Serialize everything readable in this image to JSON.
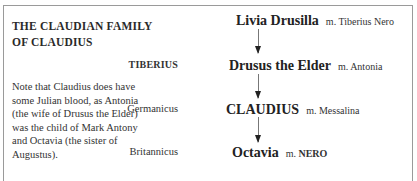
{
  "box": {
    "title": "THE CLAUDIAN FAMILY OF CLAUDIUS",
    "note": "Note that Claudius does have some Julian blood, as Antonia (the wife of Drusus the Elder) was the child of Mark Antony and Octavia (the sister of Augustus)."
  },
  "tree": {
    "generations": [
      {
        "left_label": "",
        "name": "Livia Drusilla",
        "spouse_prefix": "m.",
        "spouse": "Tiberius Nero",
        "spouse_bold": false
      },
      {
        "left_label": "TIBERIUS",
        "name": "Drusus the Elder",
        "spouse_prefix": "m.",
        "spouse": "Antonia",
        "spouse_bold": false
      },
      {
        "left_label": "Germanicus",
        "name": "CLAUDIUS",
        "spouse_prefix": "m.",
        "spouse": "Messalina",
        "spouse_bold": false
      },
      {
        "left_label": "Britannicus",
        "name": "Octavia",
        "spouse_prefix": "m.",
        "spouse": "NERO",
        "spouse_bold": true
      }
    ]
  }
}
